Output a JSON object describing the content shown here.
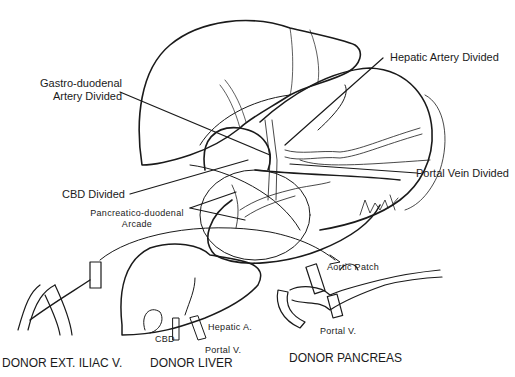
{
  "figure": {
    "type": "surgical-illustration"
  },
  "labels": {
    "gastroduodenal_line1": "Gastro-duodenal",
    "gastroduodenal_line2": "Artery Divided",
    "hepatic_artery": "Hepatic Artery Divided",
    "portal_vein_divided": "Portal Vein Divided",
    "cbd_divided": "CBD Divided",
    "pd_arcade_line1": "Pancreatico-duodenal",
    "pd_arcade_line2": "Arcade",
    "aortic_patch": "Aortic Patch",
    "liver_cbd": "CBD",
    "liver_hepatic_a": "Hepatic A.",
    "liver_portal_v": "Portal V.",
    "pancreas_portal_v": "Portal V.",
    "signature": "Frock '86"
  },
  "captions": {
    "iliac": "DONOR EXT. ILIAC V.",
    "liver": "DONOR LIVER",
    "pancreas": "DONOR PANCREAS"
  },
  "colors": {
    "ink": "#1a1a1a",
    "background": "#ffffff"
  }
}
